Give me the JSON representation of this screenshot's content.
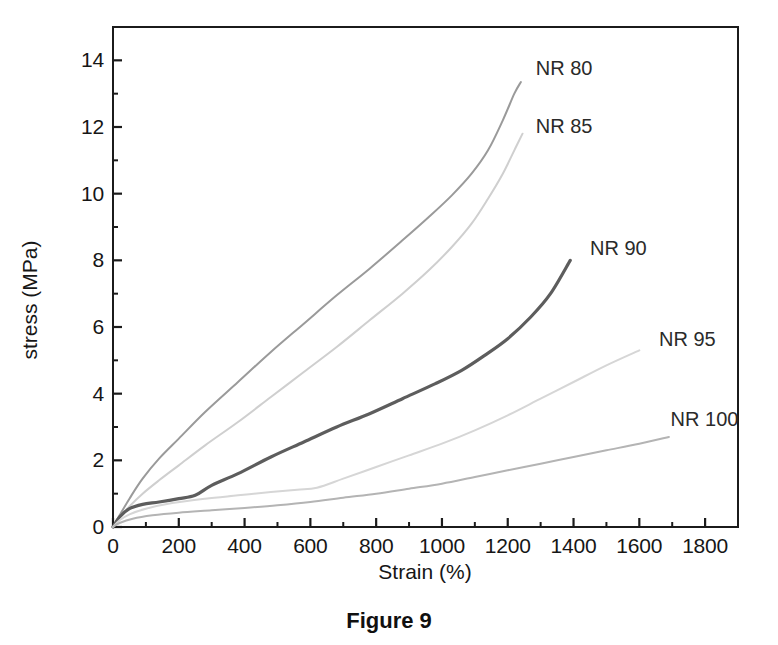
{
  "caption": "Figure 9",
  "chart_data": {
    "type": "line",
    "title": "",
    "xlabel": "Strain (%)",
    "ylabel": "stress (MPa)",
    "xlim": [
      0,
      1900
    ],
    "ylim": [
      0,
      15
    ],
    "xticks": [
      0,
      200,
      400,
      600,
      800,
      1000,
      1200,
      1400,
      1600,
      1800
    ],
    "xticklabels": [
      "0",
      "200",
      "400",
      "600",
      "800",
      "1000",
      "1200",
      "1400",
      "1600",
      "1800"
    ],
    "yticks": [
      0,
      2,
      4,
      6,
      8,
      10,
      12,
      14
    ],
    "yticklabels": [
      "0",
      "2",
      "4",
      "6",
      "8",
      "10",
      "12",
      "14"
    ],
    "minor_ticks": true,
    "grid": false,
    "legend_position": "inline-end-of-curve",
    "series": [
      {
        "name": "NR 80",
        "color": "#9a9a9a",
        "label_x": 1285,
        "label_y": 13.75,
        "x": [
          0,
          20,
          50,
          90,
          140,
          200,
          280,
          380,
          480,
          580,
          680,
          780,
          880,
          960,
          1030,
          1090,
          1140,
          1185,
          1220,
          1240
        ],
        "y": [
          0,
          0.35,
          0.85,
          1.45,
          2.05,
          2.65,
          3.45,
          4.35,
          5.25,
          6.1,
          6.95,
          7.75,
          8.6,
          9.3,
          9.95,
          10.6,
          11.3,
          12.2,
          13.0,
          13.35
        ]
      },
      {
        "name": "NR 85",
        "color": "#cfcfcf",
        "label_x": 1285,
        "label_y": 12.0,
        "x": [
          0,
          20,
          50,
          90,
          140,
          200,
          280,
          380,
          480,
          580,
          680,
          780,
          880,
          960,
          1030,
          1090,
          1140,
          1185,
          1220,
          1245
        ],
        "y": [
          0,
          0.28,
          0.62,
          1.0,
          1.4,
          1.85,
          2.45,
          3.15,
          3.9,
          4.65,
          5.4,
          6.2,
          7.0,
          7.7,
          8.4,
          9.1,
          9.85,
          10.6,
          11.3,
          11.8
        ]
      },
      {
        "name": "NR 90",
        "color": "#5d5d5d",
        "label_x": 1450,
        "label_y": 8.35,
        "x": [
          0,
          20,
          50,
          90,
          140,
          200,
          250,
          300,
          380,
          480,
          580,
          680,
          780,
          880,
          980,
          1060,
          1130,
          1200,
          1270,
          1330,
          1390
        ],
        "y": [
          0,
          0.3,
          0.55,
          0.68,
          0.75,
          0.85,
          0.95,
          1.25,
          1.6,
          2.1,
          2.55,
          3.0,
          3.4,
          3.85,
          4.3,
          4.7,
          5.15,
          5.65,
          6.3,
          7.0,
          8.0
        ]
      },
      {
        "name": "NR 95",
        "color": "#d6d6d6",
        "label_x": 1660,
        "label_y": 5.6,
        "x": [
          0,
          20,
          50,
          100,
          180,
          280,
          380,
          480,
          560,
          620,
          700,
          800,
          900,
          1000,
          1100,
          1200,
          1300,
          1400,
          1500,
          1600
        ],
        "y": [
          0,
          0.2,
          0.38,
          0.55,
          0.72,
          0.85,
          0.95,
          1.05,
          1.12,
          1.18,
          1.45,
          1.8,
          2.15,
          2.5,
          2.9,
          3.35,
          3.85,
          4.35,
          4.85,
          5.3
        ]
      },
      {
        "name": "NR 100",
        "color": "#b4b4b4",
        "label_x": 1695,
        "label_y": 3.2,
        "x": [
          0,
          20,
          60,
          120,
          200,
          300,
          400,
          500,
          600,
          700,
          800,
          900,
          1000,
          1100,
          1200,
          1300,
          1400,
          1500,
          1600,
          1690
        ],
        "y": [
          0,
          0.12,
          0.25,
          0.35,
          0.43,
          0.5,
          0.57,
          0.65,
          0.75,
          0.88,
          1.0,
          1.15,
          1.3,
          1.5,
          1.7,
          1.9,
          2.1,
          2.3,
          2.5,
          2.7
        ]
      }
    ]
  }
}
